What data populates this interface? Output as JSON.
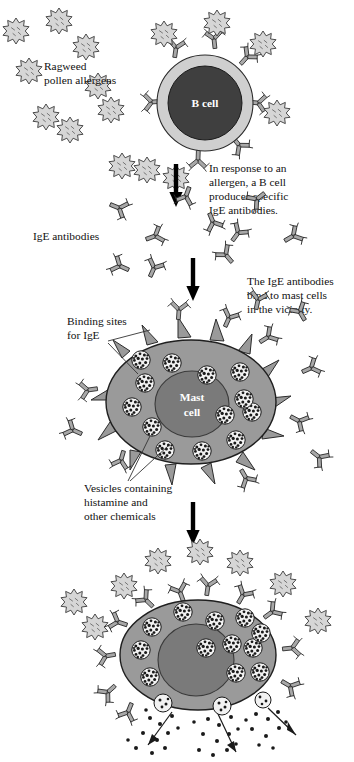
{
  "figure": {
    "background_color": "#ffffff"
  },
  "palette": {
    "allergen_fill": "#d6d6d6",
    "allergen_stroke": "#3a3a3a",
    "antibody_fill": "#a8a8a8",
    "antibody_stroke": "#2b2b2b",
    "bcell_ring": "#cfcfcf",
    "bcell_nucleus": "#3f3f3f",
    "mastcell_body": "#9a9a9a",
    "mastcell_nucleus": "#7a7a7a",
    "vesicle_fill": "#f2f2f2",
    "vesicle_speckle": "#1a1a1a",
    "arrow_color": "#000000",
    "leader_line": "#333333",
    "text_color": "#111111",
    "cell_label_color": "#ffffff"
  },
  "labels": {
    "ragweed": {
      "line1": "Ragweed",
      "line2": "pollen allergens",
      "x": 44,
      "y": 70
    },
    "bcell": {
      "text": "B cell",
      "x": 203,
      "y": 119
    },
    "bcell_caption": {
      "line1": "In response to an",
      "line2": "allergen, a B cell",
      "line3": "produces specific",
      "line4": "IgE antibodies.",
      "x": 209,
      "y": 172
    },
    "ige_antibodies": {
      "text": "IgE antibodies",
      "x": 63,
      "y": 237
    },
    "ige_caption": {
      "line1": "The IgE antibodies",
      "line2": "bind to mast cells",
      "line3": "in the vicinity.",
      "x": 247,
      "y": 285
    },
    "binding_sites": {
      "line1": "Binding sites",
      "line2": "for IgE",
      "x": 67,
      "y": 325
    },
    "mastcell": {
      "line1": "Mast",
      "line2": "cell",
      "x": 180,
      "y": 404
    },
    "vesicles": {
      "line1": "Vesicles containing",
      "line2": "histamine and",
      "line3": "other chemicals",
      "x": 84,
      "y": 492
    }
  },
  "stages": [
    {
      "name": "stage-b-cell",
      "description": "B cell surrounded by ragweed pollen allergens, displaying surface IgE antibodies"
    },
    {
      "name": "stage-free-antibodies",
      "description": "Free IgE antibodies released into surroundings"
    },
    {
      "name": "stage-mast-cell",
      "description": "Mast cell with binding sites and vesicles containing histamine"
    },
    {
      "name": "stage-degranulation",
      "description": "Mast cell with bound allergens releasing histamine granules"
    }
  ],
  "arrows": [
    {
      "name": "arrow-bcell-to-antibodies",
      "x": 176,
      "y_start": 162,
      "y_end": 205
    },
    {
      "name": "arrow-antibodies-to-mastcell",
      "x": 193,
      "y_start": 256,
      "y_end": 300
    },
    {
      "name": "arrow-mastcell-to-degranulation",
      "x": 193,
      "y_start": 500,
      "y_end": 545
    }
  ],
  "allergens": {
    "count_top_left": 9,
    "count_on_bcell": 6,
    "count_on_mastcell_bottom": 8,
    "shape": "spiky-star"
  },
  "antibodies": {
    "shape": "Y-shaped",
    "count_on_bcell": 7,
    "count_free_middle": 9,
    "count_on_mastcell": 12,
    "count_on_degranulating_cell": 11
  },
  "vesicles": {
    "count_mastcell": 13,
    "count_degranulating": 12,
    "texture": "speckled"
  }
}
